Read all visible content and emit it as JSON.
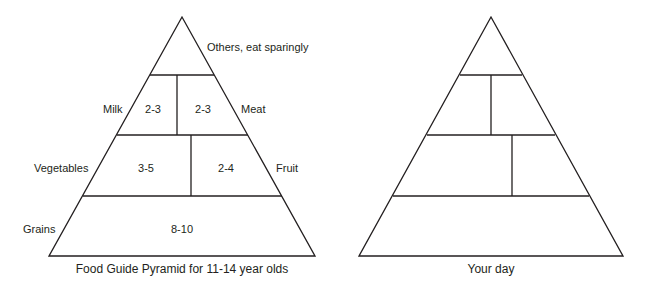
{
  "left_pyramid": {
    "caption": "Food Guide Pyramid for 11-14 year olds",
    "tiers": {
      "top": {
        "label": "Others, eat sparingly"
      },
      "milk": {
        "label": "Milk",
        "servings": "2-3"
      },
      "meat": {
        "label": "Meat",
        "servings": "2-3"
      },
      "vegetables": {
        "label": "Vegetables",
        "servings": "3-5"
      },
      "fruit": {
        "label": "Fruit",
        "servings": "2-4"
      },
      "grains": {
        "label": "Grains",
        "servings": "8-10"
      }
    }
  },
  "right_pyramid": {
    "caption": "Your day"
  },
  "colors": {
    "line": "#231f20",
    "background": "#ffffff"
  }
}
